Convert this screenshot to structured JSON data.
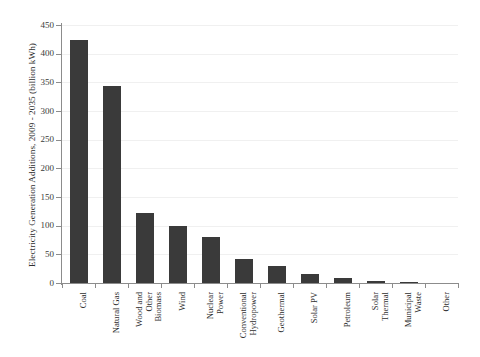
{
  "chart_data": {
    "type": "bar",
    "title": "",
    "xlabel": "",
    "ylabel": "Electricity Generation Additions, 2009 - 2035 (billion kWh)",
    "ylim": [
      0,
      450
    ],
    "yticks": [
      0,
      50,
      100,
      150,
      200,
      250,
      300,
      350,
      400,
      450
    ],
    "ytick_labels": [
      "0",
      "50",
      "100",
      "150",
      "200",
      "250",
      "300",
      "350",
      "400",
      "450"
    ],
    "grid": "horizontal",
    "legend": "none",
    "bar_color": "#3a3a3a",
    "gridline_color": "#f0f0f0",
    "axis_color": "#8c8c8c",
    "background": "#ffffff",
    "categories": [
      "Coal",
      "Natural Gas",
      "Wood and Other Biomass",
      "Wind",
      "Nuclear Power",
      "Conventional Hydropower",
      "Geothermal",
      "Solar PV",
      "Petroleum",
      "Solar Thermal",
      "Municipal Waste",
      "Other"
    ],
    "category_lines": [
      [
        "Coal"
      ],
      [
        "Natural Gas"
      ],
      [
        "Wood and",
        "Other",
        "Biomass"
      ],
      [
        "Wind"
      ],
      [
        "Nuclear",
        "Power"
      ],
      [
        "Conventional",
        "Hydropower"
      ],
      [
        "Geothermal"
      ],
      [
        "Solar PV"
      ],
      [
        "Petroleum"
      ],
      [
        "Solar",
        "Thermal"
      ],
      [
        "Municipal",
        "Waste"
      ],
      [
        "Other"
      ]
    ],
    "values": [
      424,
      343,
      122,
      99,
      80,
      42,
      30,
      16,
      8,
      3,
      1,
      0
    ]
  }
}
